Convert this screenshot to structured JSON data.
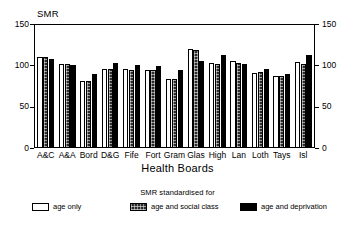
{
  "chart_data": {
    "type": "bar",
    "title": "",
    "ylabel": "SMR",
    "xlabel": "Health Boards",
    "ylim": [
      0,
      150
    ],
    "yticks": [
      0,
      50,
      100,
      150
    ],
    "grid": false,
    "dual_y_axis": true,
    "legend_position": "bottom",
    "legend_title": "SMR standardised for",
    "categories": [
      "A&C",
      "A&A",
      "Bord",
      "D&G",
      "Fife",
      "Fort",
      "Gram",
      "Glas",
      "High",
      "Lan",
      "Loth",
      "Tays",
      "Isl"
    ],
    "series": [
      {
        "name": "age only",
        "fill": "white",
        "values": [
          110,
          102,
          81,
          96,
          95,
          94,
          84,
          120,
          103,
          105,
          91,
          87,
          104
        ]
      },
      {
        "name": "age and social class",
        "fill": "hatched",
        "values": [
          110,
          102,
          81,
          96,
          94,
          94,
          84,
          119,
          102,
          103,
          92,
          87,
          102
        ]
      },
      {
        "name": "age and deprivation",
        "fill": "black",
        "values": [
          108,
          101,
          89,
          103,
          101,
          99,
          94,
          105,
          113,
          102,
          96,
          89,
          112
        ]
      }
    ],
    "colors": {
      "age_only": "#ffffff",
      "age_and_social_class": "#2b2b2b",
      "age_and_deprivation": "#000000",
      "axis": "#000000",
      "background": "#ffffff"
    }
  },
  "axes": {
    "left_tick_labels": [
      "150",
      "100",
      "50",
      "0"
    ],
    "right_tick_labels": [
      "150",
      "100",
      "50",
      "0"
    ]
  }
}
